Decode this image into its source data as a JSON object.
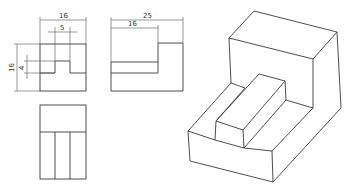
{
  "front_view": {
    "dims": {
      "overall_width": "16",
      "slot_width": "5",
      "overall_height": "16",
      "slot_depth": "4"
    }
  },
  "side_view": {
    "dims": {
      "overall_depth": "25",
      "lower_depth": "16"
    }
  },
  "top_view": {},
  "isometric_view": {},
  "colors": {
    "line": "#3a3a3a",
    "background": "#ffffff"
  }
}
